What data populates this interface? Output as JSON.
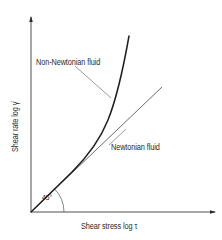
{
  "figure": {
    "type": "rheology-flow-curve-diagram",
    "background": "#ffffff",
    "ink_color": "#2a2a2a"
  },
  "axes": {
    "x_label": "Shear stress log τ",
    "y_label": "Shear rate log γ̇",
    "origin": [
      31,
      212
    ],
    "x_axis_end": [
      215,
      212
    ],
    "y_axis_end": [
      31,
      16
    ],
    "arrows": true
  },
  "curves": [
    {
      "id": "non-newtonian",
      "label": "Non-Newtonian fluid",
      "style": "thick",
      "description": "Starts at origin tangent to the 45° line, then curves upward steeply"
    },
    {
      "id": "newtonian",
      "label": "Newtonian fluid",
      "style": "thin",
      "description": "Straight line from origin at 45°"
    }
  ],
  "annotations": {
    "angle": {
      "text": "45°",
      "arc_radius": 33
    },
    "non_newtonian_label": "Non-Newtonian fluid",
    "newtonian_label": "Newtonian fluid"
  }
}
